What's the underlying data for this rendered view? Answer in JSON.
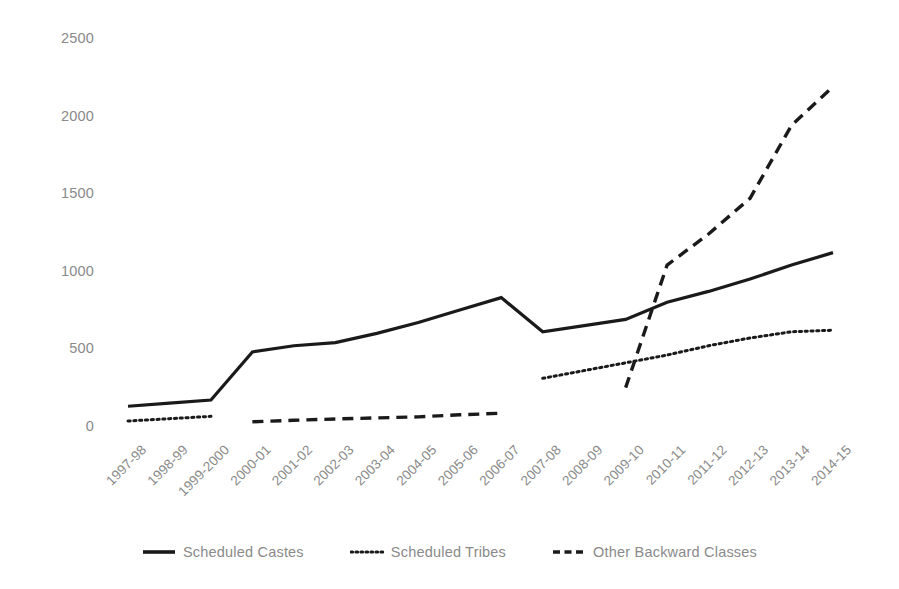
{
  "chart_data": {
    "type": "line",
    "title": "",
    "xlabel": "",
    "ylabel": "",
    "ylim": [
      0,
      2500
    ],
    "yticks": [
      0,
      500,
      1000,
      1500,
      2000,
      2500
    ],
    "grid": false,
    "legend_position": "bottom",
    "categories": [
      "1997-98",
      "1998-99",
      "1999-2000",
      "2000-01",
      "2001-02",
      "2002-03",
      "2003-04",
      "2004-05",
      "2005-06",
      "2006-07",
      "2007-08",
      "2008-09",
      "2009-10",
      "2010-11",
      "2011-12",
      "2012-13",
      "2013-14",
      "2014-15"
    ],
    "series": [
      {
        "name": "Scheduled Castes",
        "style": "solid",
        "color": "#1a1a1a",
        "values": [
          140,
          160,
          180,
          490,
          530,
          550,
          610,
          680,
          760,
          840,
          620,
          660,
          700,
          810,
          880,
          960,
          1050,
          1130
        ]
      },
      {
        "name": "Scheduled Tribes",
        "style": "dotted",
        "color": "#1a1a1a",
        "values": [
          45,
          60,
          75,
          null,
          null,
          null,
          null,
          null,
          null,
          null,
          320,
          370,
          420,
          470,
          530,
          580,
          620,
          630
        ]
      },
      {
        "name": "Other Backward Classes",
        "style": "dashed",
        "color": "#1a1a1a",
        "values": [
          null,
          null,
          null,
          40,
          50,
          58,
          65,
          72,
          85,
          95,
          null,
          null,
          260,
          1050,
          1250,
          1480,
          1950,
          2200
        ]
      }
    ]
  },
  "legend": {
    "items": [
      {
        "label": "Scheduled Castes",
        "key": "solid-line-key"
      },
      {
        "label": "Scheduled Tribes",
        "key": "dotted-line-key"
      },
      {
        "label": "Other Backward Classes",
        "key": "dashed-line-key"
      }
    ]
  },
  "axes": {
    "y_tick_labels": [
      "2500",
      "2000",
      "1500",
      "1000",
      "500",
      "0"
    ],
    "x_tick_labels": [
      "1997-98",
      "1998-99",
      "1999-2000",
      "2000-01",
      "2001-02",
      "2002-03",
      "2003-04",
      "2004-05",
      "2005-06",
      "2006-07",
      "2007-08",
      "2008-09",
      "2009-10",
      "2010-11",
      "2011-12",
      "2012-13",
      "2013-14",
      "2014-15"
    ]
  }
}
